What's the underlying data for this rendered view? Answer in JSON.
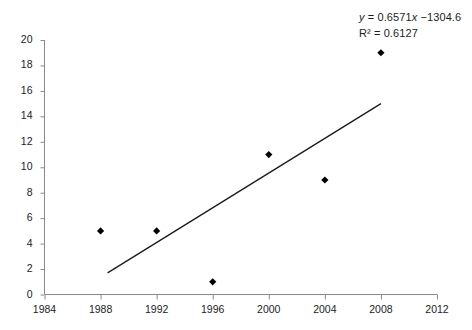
{
  "chart_data": {
    "type": "scatter",
    "title": "",
    "xlabel": "",
    "ylabel": "",
    "xlim": [
      1984,
      2012
    ],
    "ylim": [
      0,
      20
    ],
    "xticks": [
      1984,
      1988,
      1992,
      1996,
      2000,
      2004,
      2008,
      2012
    ],
    "yticks": [
      0,
      2,
      4,
      6,
      8,
      10,
      12,
      14,
      16,
      18,
      20
    ],
    "grid": false,
    "legend": false,
    "series": [
      {
        "name": "data",
        "marker": "diamond",
        "color": "#000000",
        "x": [
          1988,
          1992,
          1996,
          2000,
          2004,
          2008
        ],
        "values": [
          5,
          5,
          1,
          11,
          9,
          19
        ],
        "points": [
          {
            "x": 1988,
            "y": 5
          },
          {
            "x": 1992,
            "y": 5
          },
          {
            "x": 1996,
            "y": 1
          },
          {
            "x": 2000,
            "y": 11
          },
          {
            "x": 2004,
            "y": 9
          },
          {
            "x": 2008,
            "y": 19
          }
        ]
      }
    ],
    "trendline": {
      "type": "linear",
      "slope": 0.6571,
      "intercept": -1304.6,
      "x_start": 1988.5,
      "x_end": 2008.0,
      "y_start": 1.7,
      "y_end": 15.0,
      "color": "#1a1a1a"
    },
    "annotations": {
      "equation": "y = 0.6571x −1304.6",
      "equation_parts": {
        "y": "y",
        "rest": " = 0.6571",
        "x": "x",
        "tail": " −1304.6"
      },
      "r_squared": "R² = 0.6127",
      "r_squared_value": 0.6127
    },
    "xtick_labels": [
      "1984",
      "1988",
      "1992",
      "1996",
      "2000",
      "2004",
      "2008",
      "2012"
    ],
    "ytick_labels": [
      "0",
      "2",
      "4",
      "6",
      "8",
      "10",
      "12",
      "14",
      "16",
      "18",
      "20"
    ]
  },
  "axes": {
    "axis_color": "#8a8a8a",
    "tick_color": "#8a8a8a"
  }
}
